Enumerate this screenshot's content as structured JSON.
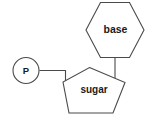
{
  "diagram": {
    "background_color": "#ffffff",
    "stroke_color": "#4a4a4a",
    "text_color": "#1a1a1a",
    "components": {
      "phosphate": {
        "label": "P",
        "shape": "circle",
        "name": "phosphate-group"
      },
      "sugar": {
        "label": "sugar",
        "shape": "pentagon",
        "name": "sugar-group"
      },
      "base": {
        "label": "base",
        "shape": "hexagon",
        "name": "nitrogenous-base-group"
      }
    },
    "bonds": [
      {
        "from": "phosphate",
        "to": "sugar",
        "name": "phosphate-sugar-bond"
      },
      {
        "from": "sugar",
        "to": "base",
        "name": "sugar-base-bond"
      }
    ]
  }
}
